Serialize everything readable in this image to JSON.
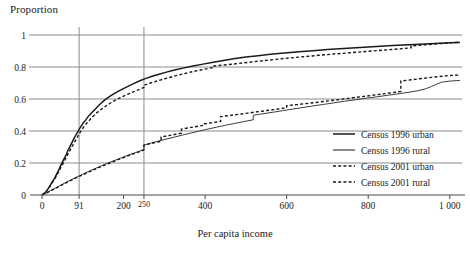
{
  "chart_data": {
    "type": "line",
    "title": "",
    "xlabel": "Per capita income",
    "ylabel": "Proportion",
    "xlim": [
      0,
      1030
    ],
    "ylim": [
      0,
      1
    ],
    "grid": true,
    "grid_x_values": [
      91,
      250
    ],
    "grid_y_values": [
      0.2,
      0.4,
      0.6,
      0.8,
      1
    ],
    "legend_position": "bottom-right",
    "xticks": [
      {
        "value": 0,
        "label": "0"
      },
      {
        "value": 91,
        "label": "91"
      },
      {
        "value": 200,
        "label": "200"
      },
      {
        "value": 250,
        "label": "250"
      },
      {
        "value": 400,
        "label": "400"
      },
      {
        "value": 600,
        "label": "600"
      },
      {
        "value": 800,
        "label": "800"
      },
      {
        "value": 1000,
        "label": "1 000"
      }
    ],
    "yticks": [
      {
        "value": 0,
        "label": "0"
      },
      {
        "value": 0.2,
        "label": "0.2"
      },
      {
        "value": 0.4,
        "label": "0.4"
      },
      {
        "value": 0.6,
        "label": "0.6"
      },
      {
        "value": 0.8,
        "label": "0.8"
      },
      {
        "value": 1,
        "label": "1"
      }
    ],
    "series": [
      {
        "name": "Census 1996 urban",
        "style": "solid",
        "color": "#1a1a1a",
        "width": 1.5,
        "points": [
          [
            0,
            0.0
          ],
          [
            8,
            0.015
          ],
          [
            14,
            0.035
          ],
          [
            20,
            0.06
          ],
          [
            26,
            0.085
          ],
          [
            31,
            0.105
          ],
          [
            36,
            0.13
          ],
          [
            41,
            0.155
          ],
          [
            46,
            0.185
          ],
          [
            50,
            0.205
          ],
          [
            55,
            0.23
          ],
          [
            59,
            0.25
          ],
          [
            63,
            0.275
          ],
          [
            67,
            0.295
          ],
          [
            71,
            0.315
          ],
          [
            75,
            0.335
          ],
          [
            79,
            0.355
          ],
          [
            83,
            0.375
          ],
          [
            87,
            0.392
          ],
          [
            91,
            0.41
          ],
          [
            96,
            0.43
          ],
          [
            101,
            0.45
          ],
          [
            107,
            0.468
          ],
          [
            113,
            0.49
          ],
          [
            120,
            0.51
          ],
          [
            128,
            0.53
          ],
          [
            136,
            0.552
          ],
          [
            144,
            0.572
          ],
          [
            152,
            0.59
          ],
          [
            161,
            0.607
          ],
          [
            170,
            0.622
          ],
          [
            180,
            0.638
          ],
          [
            190,
            0.652
          ],
          [
            201,
            0.666
          ],
          [
            213,
            0.682
          ],
          [
            226,
            0.698
          ],
          [
            240,
            0.714
          ],
          [
            255,
            0.729
          ],
          [
            270,
            0.742
          ],
          [
            287,
            0.755
          ],
          [
            305,
            0.768
          ],
          [
            325,
            0.781
          ],
          [
            346,
            0.793
          ],
          [
            370,
            0.806
          ],
          [
            395,
            0.818
          ],
          [
            420,
            0.83
          ],
          [
            445,
            0.841
          ],
          [
            470,
            0.851
          ],
          [
            500,
            0.862
          ],
          [
            530,
            0.871
          ],
          [
            560,
            0.879
          ],
          [
            595,
            0.887
          ],
          [
            630,
            0.895
          ],
          [
            665,
            0.902
          ],
          [
            700,
            0.909
          ],
          [
            740,
            0.916
          ],
          [
            780,
            0.922
          ],
          [
            820,
            0.928
          ],
          [
            860,
            0.934
          ],
          [
            900,
            0.939
          ],
          [
            940,
            0.944
          ],
          [
            975,
            0.948
          ],
          [
            1000,
            0.951
          ],
          [
            1025,
            0.953
          ]
        ]
      },
      {
        "name": "Census 1996 rural",
        "style": "solid",
        "color": "#3d3d3d",
        "width": 1.0,
        "points": [
          [
            0,
            0.0
          ],
          [
            10,
            0.012
          ],
          [
            20,
            0.026
          ],
          [
            32,
            0.042
          ],
          [
            45,
            0.06
          ],
          [
            58,
            0.078
          ],
          [
            72,
            0.096
          ],
          [
            86,
            0.113
          ],
          [
            100,
            0.13
          ],
          [
            115,
            0.148
          ],
          [
            130,
            0.165
          ],
          [
            146,
            0.183
          ],
          [
            162,
            0.2
          ],
          [
            178,
            0.216
          ],
          [
            195,
            0.233
          ],
          [
            212,
            0.25
          ],
          [
            230,
            0.266
          ],
          [
            248,
            0.282
          ],
          [
            250,
            0.284
          ],
          [
            250,
            0.312
          ],
          [
            268,
            0.325
          ],
          [
            287,
            0.338
          ],
          [
            306,
            0.35
          ],
          [
            325,
            0.362
          ],
          [
            345,
            0.375
          ],
          [
            365,
            0.387
          ],
          [
            386,
            0.4
          ],
          [
            407,
            0.412
          ],
          [
            428,
            0.424
          ],
          [
            450,
            0.436
          ],
          [
            472,
            0.447
          ],
          [
            495,
            0.459
          ],
          [
            518,
            0.47
          ],
          [
            518,
            0.498
          ],
          [
            542,
            0.508
          ],
          [
            566,
            0.517
          ],
          [
            590,
            0.527
          ],
          [
            615,
            0.537
          ],
          [
            640,
            0.547
          ],
          [
            665,
            0.557
          ],
          [
            690,
            0.566
          ],
          [
            716,
            0.576
          ],
          [
            742,
            0.586
          ],
          [
            768,
            0.595
          ],
          [
            795,
            0.605
          ],
          [
            822,
            0.614
          ],
          [
            850,
            0.624
          ],
          [
            878,
            0.634
          ],
          [
            900,
            0.642
          ],
          [
            920,
            0.651
          ],
          [
            940,
            0.663
          ],
          [
            955,
            0.678
          ],
          [
            968,
            0.693
          ],
          [
            980,
            0.705
          ],
          [
            1000,
            0.712
          ],
          [
            1025,
            0.716
          ]
        ]
      },
      {
        "name": "Census 2001 urban",
        "style": "dashed",
        "color": "#1a1a1a",
        "width": 1.4,
        "points": [
          [
            0,
            0.0
          ],
          [
            9,
            0.018
          ],
          [
            16,
            0.04
          ],
          [
            23,
            0.068
          ],
          [
            29,
            0.092
          ],
          [
            35,
            0.118
          ],
          [
            41,
            0.145
          ],
          [
            46,
            0.172
          ],
          [
            52,
            0.198
          ],
          [
            57,
            0.222
          ],
          [
            62,
            0.248
          ],
          [
            67,
            0.272
          ],
          [
            72,
            0.295
          ],
          [
            77,
            0.318
          ],
          [
            82,
            0.34
          ],
          [
            87,
            0.362
          ],
          [
            91,
            0.382
          ],
          [
            97,
            0.405
          ],
          [
            103,
            0.428
          ],
          [
            110,
            0.45
          ],
          [
            118,
            0.472
          ],
          [
            126,
            0.494
          ],
          [
            135,
            0.515
          ],
          [
            145,
            0.535
          ],
          [
            155,
            0.553
          ],
          [
            166,
            0.572
          ],
          [
            178,
            0.59
          ],
          [
            191,
            0.607
          ],
          [
            205,
            0.624
          ],
          [
            220,
            0.64
          ],
          [
            236,
            0.657
          ],
          [
            250,
            0.672
          ],
          [
            250,
            0.686
          ],
          [
            266,
            0.7
          ],
          [
            284,
            0.714
          ],
          [
            303,
            0.728
          ],
          [
            323,
            0.742
          ],
          [
            345,
            0.756
          ],
          [
            368,
            0.77
          ],
          [
            392,
            0.783
          ],
          [
            418,
            0.796
          ],
          [
            418,
            0.806
          ],
          [
            445,
            0.812
          ],
          [
            475,
            0.82
          ],
          [
            505,
            0.829
          ],
          [
            537,
            0.838
          ],
          [
            570,
            0.847
          ],
          [
            605,
            0.856
          ],
          [
            640,
            0.864
          ],
          [
            678,
            0.873
          ],
          [
            715,
            0.881
          ],
          [
            755,
            0.889
          ],
          [
            795,
            0.897
          ],
          [
            835,
            0.905
          ],
          [
            875,
            0.913
          ],
          [
            905,
            0.92
          ],
          [
            905,
            0.932
          ],
          [
            940,
            0.939
          ],
          [
            975,
            0.946
          ],
          [
            1000,
            0.951
          ],
          [
            1025,
            0.956
          ]
        ]
      },
      {
        "name": "Census 2001 rural",
        "style": "dashed",
        "color": "#1a1a1a",
        "width": 1.4,
        "points": [
          [
            0,
            0.0
          ],
          [
            12,
            0.014
          ],
          [
            24,
            0.03
          ],
          [
            38,
            0.048
          ],
          [
            52,
            0.067
          ],
          [
            67,
            0.086
          ],
          [
            82,
            0.105
          ],
          [
            98,
            0.124
          ],
          [
            114,
            0.143
          ],
          [
            131,
            0.162
          ],
          [
            148,
            0.181
          ],
          [
            166,
            0.2
          ],
          [
            184,
            0.218
          ],
          [
            203,
            0.237
          ],
          [
            222,
            0.255
          ],
          [
            240,
            0.272
          ],
          [
            250,
            0.282
          ],
          [
            250,
            0.312
          ],
          [
            264,
            0.32
          ],
          [
            278,
            0.328
          ],
          [
            292,
            0.336
          ],
          [
            292,
            0.362
          ],
          [
            308,
            0.37
          ],
          [
            325,
            0.378
          ],
          [
            342,
            0.386
          ],
          [
            342,
            0.412
          ],
          [
            360,
            0.42
          ],
          [
            379,
            0.428
          ],
          [
            398,
            0.436
          ],
          [
            398,
            0.445
          ],
          [
            418,
            0.452
          ],
          [
            438,
            0.46
          ],
          [
            438,
            0.49
          ],
          [
            460,
            0.497
          ],
          [
            482,
            0.504
          ],
          [
            505,
            0.512
          ],
          [
            528,
            0.52
          ],
          [
            552,
            0.528
          ],
          [
            576,
            0.536
          ],
          [
            600,
            0.545
          ],
          [
            600,
            0.558
          ],
          [
            625,
            0.565
          ],
          [
            650,
            0.572
          ],
          [
            676,
            0.58
          ],
          [
            702,
            0.588
          ],
          [
            728,
            0.596
          ],
          [
            755,
            0.605
          ],
          [
            782,
            0.614
          ],
          [
            810,
            0.623
          ],
          [
            838,
            0.632
          ],
          [
            866,
            0.642
          ],
          [
            880,
            0.648
          ],
          [
            880,
            0.712
          ],
          [
            905,
            0.72
          ],
          [
            930,
            0.728
          ],
          [
            955,
            0.735
          ],
          [
            980,
            0.742
          ],
          [
            1000,
            0.747
          ],
          [
            1025,
            0.75
          ]
        ]
      }
    ]
  },
  "legend": {
    "items": [
      {
        "label": "Census 1996 urban",
        "style": "solid",
        "color": "#1a1a1a"
      },
      {
        "label": "Census 1996 rural",
        "style": "solid",
        "color": "#3d3d3d"
      },
      {
        "label": "Census 2001 urban",
        "style": "dashed",
        "color": "#1a1a1a"
      },
      {
        "label": "Census 2001 rural",
        "style": "dashed",
        "color": "#1a1a1a"
      }
    ]
  },
  "axes": {
    "y_title": "Proportion",
    "x_title": "Per capita income"
  }
}
